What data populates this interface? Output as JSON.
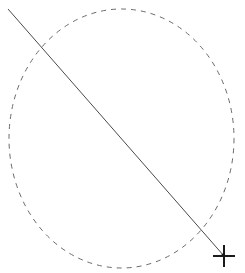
{
  "canvas": {
    "width": 245,
    "height": 273,
    "background": "#ffffff"
  },
  "shapes": {
    "ellipse": {
      "cx": 121.5,
      "cy": 138.5,
      "rx": 112.5,
      "ry": 129.5,
      "stroke": "#6a6a6a",
      "dash": "5 5",
      "style": "dashed"
    },
    "line": {
      "x1": 8,
      "y1": 9,
      "x2": 224,
      "y2": 256,
      "stroke": "#4a4a4a"
    }
  },
  "cursor": {
    "icon": "crosshair-cursor",
    "x": 224,
    "y": 256,
    "color": "#1a1a1a"
  }
}
